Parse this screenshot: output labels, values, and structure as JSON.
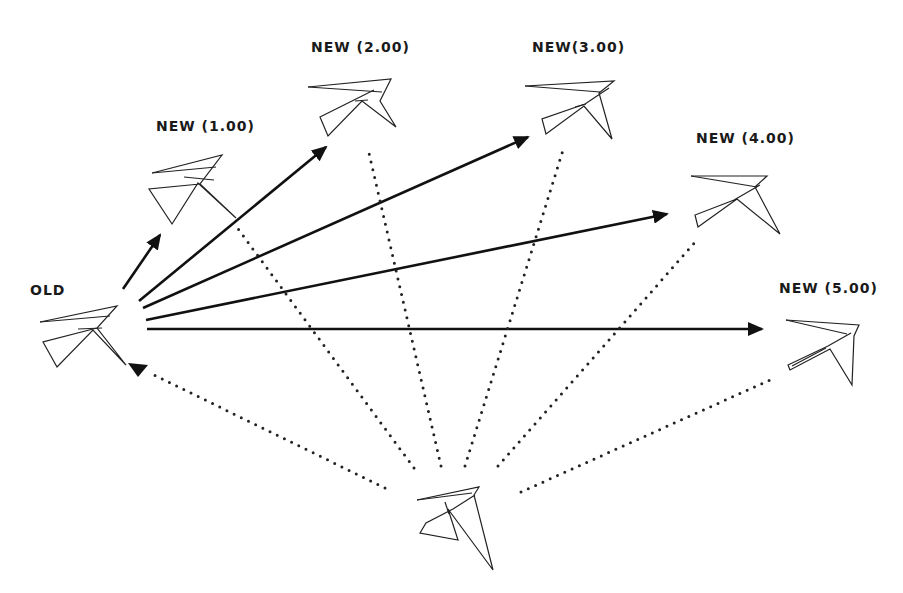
{
  "diagram": {
    "labels": {
      "old": "OLD",
      "new1": "NEW (1.00)",
      "new2": "NEW (2.00)",
      "new3": "NEW(3.00)",
      "new4": "NEW (4.00)",
      "new5": "NEW (5.00)"
    },
    "nodes": [
      {
        "id": "old",
        "label": "OLD"
      },
      {
        "id": "new1",
        "label": "NEW (1.00)"
      },
      {
        "id": "new2",
        "label": "NEW (2.00)"
      },
      {
        "id": "new3",
        "label": "NEW(3.00)"
      },
      {
        "id": "new4",
        "label": "NEW (4.00)"
      },
      {
        "id": "new5",
        "label": "NEW (5.00)"
      },
      {
        "id": "base",
        "label": ""
      }
    ],
    "edges": [
      {
        "from": "old",
        "to": "new1",
        "style": "solid-arrow"
      },
      {
        "from": "old",
        "to": "new2",
        "style": "solid-arrow"
      },
      {
        "from": "old",
        "to": "new3",
        "style": "solid-arrow"
      },
      {
        "from": "old",
        "to": "new4",
        "style": "solid-arrow"
      },
      {
        "from": "old",
        "to": "new5",
        "style": "solid-arrow"
      },
      {
        "from": "base",
        "to": "old",
        "style": "dotted-arrow"
      },
      {
        "from": "base",
        "to": "new1",
        "style": "dotted"
      },
      {
        "from": "base",
        "to": "new2",
        "style": "dotted"
      },
      {
        "from": "base",
        "to": "new3",
        "style": "dotted"
      },
      {
        "from": "base",
        "to": "new4",
        "style": "dotted"
      },
      {
        "from": "base",
        "to": "new5",
        "style": "dotted"
      }
    ]
  }
}
